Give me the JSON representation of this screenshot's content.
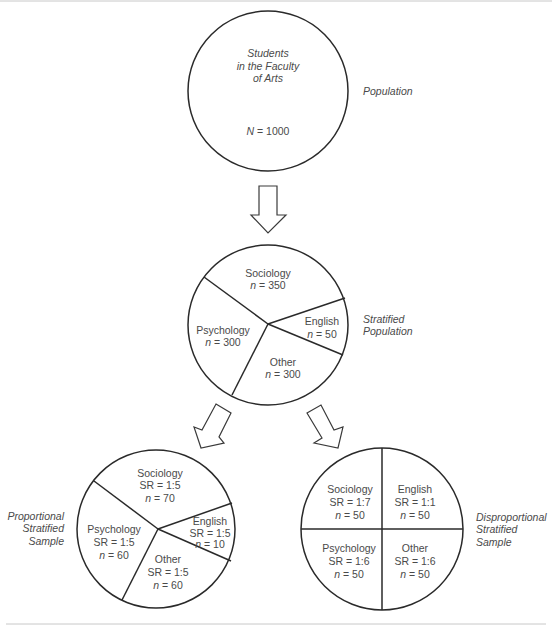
{
  "diagram": {
    "colors": {
      "line": "#2a2a2a",
      "text": "#4a4a4a",
      "rule": "#c8c8c8"
    },
    "population": {
      "label": "Population",
      "lines": [
        "Students",
        "in the Faculty",
        "of Arts"
      ],
      "n_var": "N",
      "n_text": " = 1000"
    },
    "stratified_population": {
      "label_lines": [
        "Stratified",
        "Population"
      ],
      "strata": [
        {
          "name": "Sociology",
          "n_var": "n",
          "n_text": " = 350"
        },
        {
          "name": "English",
          "n_var": "n",
          "n_text": " = 50"
        },
        {
          "name": "Other",
          "n_var": "n",
          "n_text": " = 300"
        },
        {
          "name": "Psychology",
          "n_var": "n",
          "n_text": " = 300"
        }
      ]
    },
    "proportional_sample": {
      "label_lines": [
        "Proportional",
        "Stratified",
        "Sample"
      ],
      "strata": [
        {
          "name": "Sociology",
          "sr": "SR = 1:5",
          "n_var": "n",
          "n_text": " = 70"
        },
        {
          "name": "English",
          "sr": "SR = 1:5",
          "n_var": "n",
          "n_text": " = 10"
        },
        {
          "name": "Other",
          "sr": "SR = 1:5",
          "n_var": "n",
          "n_text": " = 60"
        },
        {
          "name": "Psychology",
          "sr": "SR = 1:5",
          "n_var": "n",
          "n_text": " = 60"
        }
      ]
    },
    "disproportional_sample": {
      "label_lines": [
        "Disproportional",
        "Stratified",
        "Sample"
      ],
      "strata": [
        {
          "name": "Sociology",
          "sr": "SR = 1:7",
          "n_var": "n",
          "n_text": " = 50"
        },
        {
          "name": "English",
          "sr": "SR = 1:1",
          "n_var": "n",
          "n_text": " = 50"
        },
        {
          "name": "Psychology",
          "sr": "SR = 1:6",
          "n_var": "n",
          "n_text": " = 50"
        },
        {
          "name": "Other",
          "sr": "SR = 1:6",
          "n_var": "n",
          "n_text": " = 50"
        }
      ]
    }
  }
}
